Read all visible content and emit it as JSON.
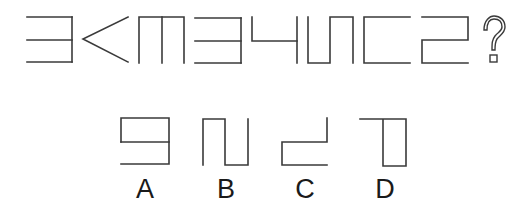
{
  "puzzle": {
    "sequence": [
      {
        "id": "fig-1",
        "shape": "three-horizontals-right-bar"
      },
      {
        "id": "fig-2",
        "shape": "less-than-chevron"
      },
      {
        "id": "fig-3",
        "shape": "top-bar-three-verticals"
      },
      {
        "id": "fig-4",
        "shape": "three-horizontals-right-bar"
      },
      {
        "id": "fig-5",
        "shape": "che-shape"
      },
      {
        "id": "fig-6",
        "shape": "meander-u-n"
      },
      {
        "id": "fig-7",
        "shape": "left-bracket-open-right"
      },
      {
        "id": "fig-8",
        "shape": "z-meander"
      }
    ],
    "question_mark": "?",
    "options": [
      {
        "label": "A",
        "shape": "rect-top-with-extra-bottom-bar"
      },
      {
        "label": "B",
        "shape": "n-u-meander"
      },
      {
        "label": "C",
        "shape": "step-shape"
      },
      {
        "label": "D",
        "shape": "top-bar-with-right-rect"
      }
    ]
  },
  "colors": {
    "stroke": "#3a3a3a",
    "background": "#ffffff",
    "label": "#1a1a1a"
  }
}
